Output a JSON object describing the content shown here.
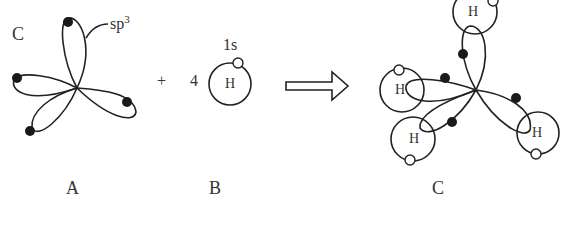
{
  "diagram": {
    "panel_a": {
      "caption": "A",
      "atom_label": "C",
      "orbital_label": "sp",
      "orbital_superscript": "3",
      "lobes": 4,
      "electron_color": "#1a1a1a"
    },
    "operator_plus": "+",
    "panel_b": {
      "caption": "B",
      "coefficient": "4",
      "atom_label": "H",
      "orbital_label": "1s",
      "electron_color": "#ffffff"
    },
    "arrow": "reaction-arrow",
    "panel_c": {
      "caption": "C",
      "hydrogen_labels": [
        "H",
        "H",
        "H",
        "H"
      ]
    },
    "colors": {
      "line": "#222222",
      "background": "#ffffff"
    }
  }
}
